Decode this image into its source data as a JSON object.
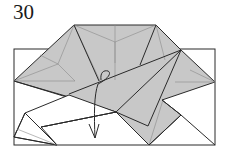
{
  "diagram": {
    "step_number": "30",
    "colors": {
      "paper_colored": "#c8c8c8",
      "paper_white": "#ffffff",
      "edge": "#2a2a2a",
      "crease": "#8a8a8a"
    },
    "arrow": {
      "type": "fold-behind-curl",
      "direction": "down"
    }
  }
}
